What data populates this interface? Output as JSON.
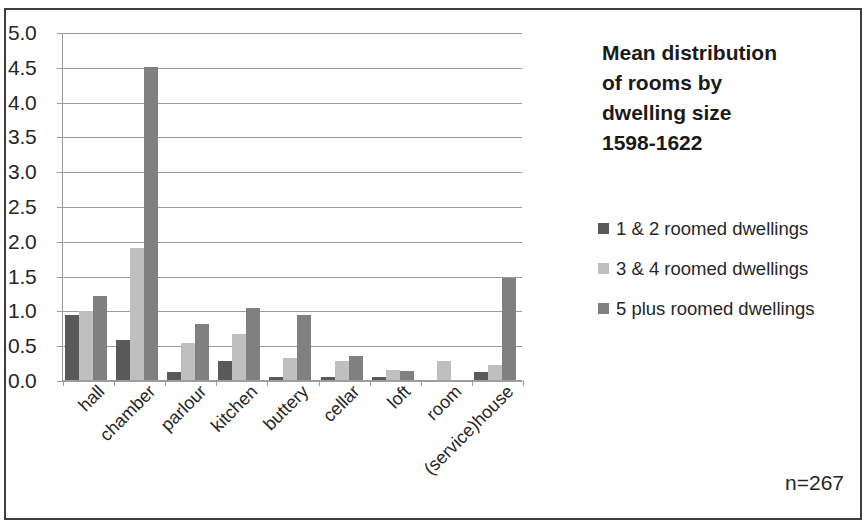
{
  "chart_data": {
    "type": "bar",
    "title_lines": [
      "Mean distribution",
      "of rooms by",
      "dwelling size",
      "1598-1622"
    ],
    "xlabel": "",
    "ylabel": "",
    "ylim": [
      0.0,
      5.0
    ],
    "ytick_step": 0.5,
    "ytick_labels": [
      "5.0",
      "4.5",
      "4.0",
      "3.5",
      "3.0",
      "2.5",
      "2.0",
      "1.5",
      "1.0",
      "0.5",
      "0.0"
    ],
    "grid": true,
    "legend_position": "right",
    "categories": [
      "hall",
      "chamber",
      "parlour",
      "kitchen",
      "buttery",
      "cellar",
      "loft",
      "room",
      "(service)house"
    ],
    "series": [
      {
        "name": "1 & 2 roomed dwellings",
        "color": "#595959",
        "values": [
          0.94,
          0.58,
          0.11,
          0.28,
          0.05,
          0.05,
          0.05,
          0.0,
          0.11
        ]
      },
      {
        "name": "3 & 4 roomed dwellings",
        "color": "#bfbfbf",
        "values": [
          0.99,
          1.9,
          0.53,
          0.66,
          0.32,
          0.27,
          0.14,
          0.28,
          0.22
        ]
      },
      {
        "name": "5 plus roomed dwellings",
        "color": "#808080",
        "values": [
          1.2,
          4.5,
          0.81,
          1.04,
          0.93,
          0.34,
          0.13,
          0.0,
          1.46
        ]
      }
    ],
    "annotations": [
      {
        "name": "sample-size",
        "text": "n=267"
      }
    ]
  },
  "notes": {
    "sample_size": "n=267"
  }
}
